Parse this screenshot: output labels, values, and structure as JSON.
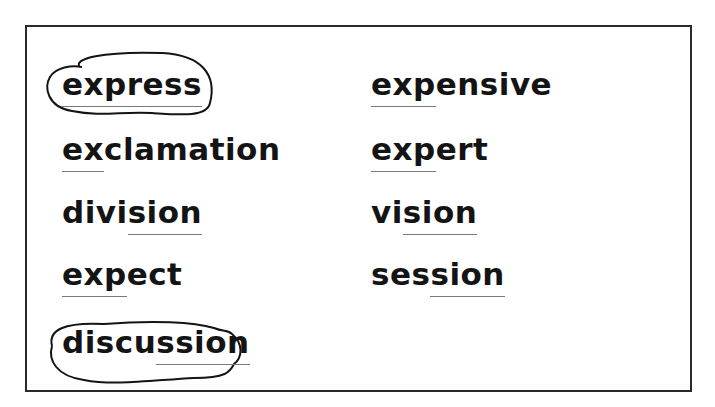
{
  "worksheet": {
    "left_column": [
      {
        "prefix": "",
        "underlined": "express",
        "suffix": "",
        "circled": true
      },
      {
        "prefix": "",
        "underlined": "ex",
        "suffix": "clamation",
        "circled": false
      },
      {
        "prefix": "divi",
        "underlined": "sion",
        "suffix": "",
        "circled": false
      },
      {
        "prefix": "",
        "underlined": "exp",
        "suffix": "ect",
        "circled": false
      },
      {
        "prefix": "discu",
        "underlined": "ssion",
        "suffix": "",
        "circled": true
      }
    ],
    "right_column": [
      {
        "prefix": "",
        "underlined": "exp",
        "suffix": "ensive",
        "circled": false
      },
      {
        "prefix": "",
        "underlined": "exp",
        "suffix": "ert",
        "circled": false
      },
      {
        "prefix": "vi",
        "underlined": "sion",
        "suffix": "",
        "circled": false
      },
      {
        "prefix": "ses",
        "underlined": "sion",
        "suffix": "",
        "circled": false
      }
    ]
  },
  "colors": {
    "ink": "#141414",
    "underline": "#7a7a7a",
    "frame": "#2a2a2a"
  }
}
